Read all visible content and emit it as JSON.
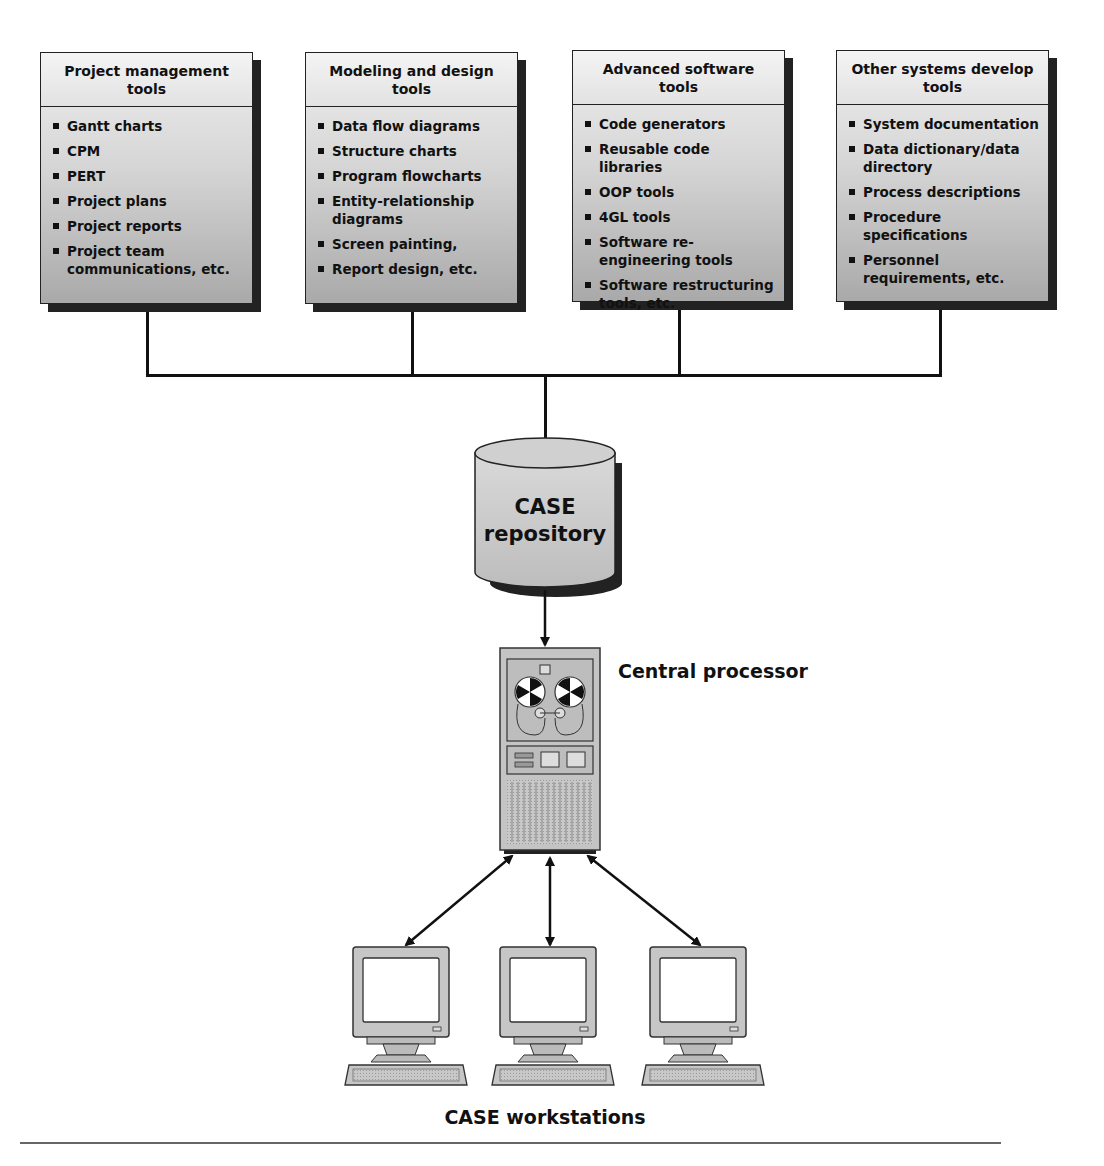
{
  "diagram": {
    "tool_boxes": [
      {
        "title": "Project management tools",
        "items": [
          "Gantt charts",
          "CPM",
          "PERT",
          "Project plans",
          "Project reports",
          "Project team communications, etc."
        ]
      },
      {
        "title": "Modeling and design tools",
        "items": [
          "Data flow diagrams",
          "Structure charts",
          "Program flowcharts",
          "Entity-relationship diagrams",
          "Screen painting,",
          "Report design, etc."
        ]
      },
      {
        "title": "Advanced software tools",
        "items": [
          "Code generators",
          "Reusable code libraries",
          "OOP tools",
          "4GL tools",
          "Software re-engineering tools",
          "Software restructuring tools, etc."
        ]
      },
      {
        "title": "Other systems develop tools",
        "items": [
          "System documentation",
          "Data dictionary/data directory",
          "Process descriptions",
          "Procedure specifications",
          "Personnel requirements, etc."
        ]
      }
    ],
    "repository": {
      "line1": "CASE",
      "line2": "repository"
    },
    "processor": {
      "label": "Central processor"
    },
    "workstations": {
      "label": "CASE workstations",
      "count": 3
    },
    "colors": {
      "box_fill_top": "#efefef",
      "box_fill_bottom": "#a9a9a9",
      "shadow": "#222222",
      "line": "#111111"
    }
  }
}
